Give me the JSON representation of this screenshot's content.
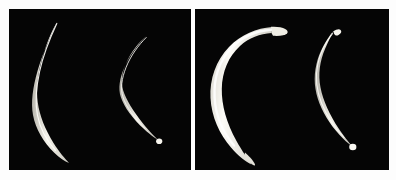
{
  "figure": {
    "name": "specimen-comparison-plate",
    "background_color": "#fdfdfd",
    "panel_background_color": "#050505",
    "specimen_color": "#f4f2ec",
    "divider_color": "#ffffff",
    "panel_count": 2,
    "caption_a": "",
    "caption_b": ""
  },
  "panels": [
    {
      "id": "panel-a",
      "label": "",
      "background_color": "#050505",
      "specimen_count": 2,
      "specimens": [
        {
          "id": "specimen-a1",
          "description": "long slender curved nematode, tapered at both ends, C-shaped curvature opening to the right",
          "relative_length": "long",
          "thickness": "slender",
          "curvature": "c-shaped",
          "color": "#f2f0e8"
        },
        {
          "id": "specimen-a2",
          "description": "shorter thin curved nematode with small bulbous tip at lower end",
          "relative_length": "short",
          "thickness": "very-slender",
          "curvature": "c-shaped",
          "color": "#eceae2"
        }
      ]
    },
    {
      "id": "panel-b",
      "label": "",
      "background_color": "#050505",
      "specimen_count": 2,
      "specimens": [
        {
          "id": "specimen-b1",
          "description": "thick strongly curved nematode with blunt rounded anterior hook at top and tapering pointed posterior end",
          "relative_length": "long",
          "thickness": "thick",
          "curvature": "hooked-c-shaped",
          "color": "#fbfaf5"
        },
        {
          "id": "specimen-b2",
          "description": "slender curved nematode with small bulbous tips at both ends",
          "relative_length": "medium",
          "thickness": "slender",
          "curvature": "c-shaped",
          "color": "#f0eee6"
        }
      ]
    }
  ]
}
